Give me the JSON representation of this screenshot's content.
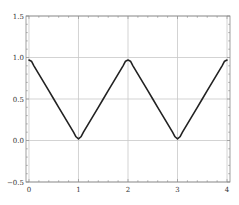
{
  "chart_data": {
    "type": "line",
    "title": "",
    "xlabel": "",
    "ylabel": "",
    "xlim": [
      -0.06,
      4.06
    ],
    "ylim": [
      -0.5,
      1.5
    ],
    "grid": true,
    "legend": null,
    "x_ticks": [
      0,
      1,
      2,
      3,
      4
    ],
    "x_tick_labels": [
      "0",
      "1",
      "2",
      "3",
      "4"
    ],
    "y_ticks": [
      -0.5,
      0.0,
      0.5,
      1.0,
      1.5
    ],
    "y_tick_labels": [
      "−0.5",
      "0.0",
      "0.5",
      "1.0",
      "1.5"
    ],
    "x_minor_step": 0.2,
    "y_minor_step": 0.1,
    "series": [
      {
        "name": "triangle wave (smoothed)",
        "color": "#222222",
        "x": [
          0.0,
          0.05,
          0.1,
          0.2,
          0.3,
          0.4,
          0.5,
          0.6,
          0.7,
          0.8,
          0.9,
          0.95,
          1.0,
          1.05,
          1.1,
          1.2,
          1.3,
          1.4,
          1.5,
          1.6,
          1.7,
          1.8,
          1.9,
          1.95,
          2.0,
          2.05,
          2.1,
          2.2,
          2.3,
          2.4,
          2.5,
          2.6,
          2.7,
          2.8,
          2.9,
          2.95,
          3.0,
          3.05,
          3.1,
          3.2,
          3.3,
          3.4,
          3.5,
          3.6,
          3.7,
          3.8,
          3.9,
          3.95,
          4.0
        ],
        "y": [
          0.97,
          0.955,
          0.9,
          0.8,
          0.7,
          0.6,
          0.5,
          0.4,
          0.3,
          0.2,
          0.1,
          0.045,
          0.02,
          0.045,
          0.1,
          0.2,
          0.3,
          0.4,
          0.5,
          0.6,
          0.7,
          0.8,
          0.9,
          0.955,
          0.97,
          0.955,
          0.9,
          0.8,
          0.7,
          0.6,
          0.5,
          0.4,
          0.3,
          0.2,
          0.1,
          0.045,
          0.02,
          0.045,
          0.1,
          0.2,
          0.3,
          0.4,
          0.5,
          0.6,
          0.7,
          0.8,
          0.9,
          0.955,
          0.97
        ]
      }
    ]
  },
  "style": {
    "grid_color": "#c8c8c8",
    "frame_color": "#888888",
    "line_color": "#222222"
  }
}
